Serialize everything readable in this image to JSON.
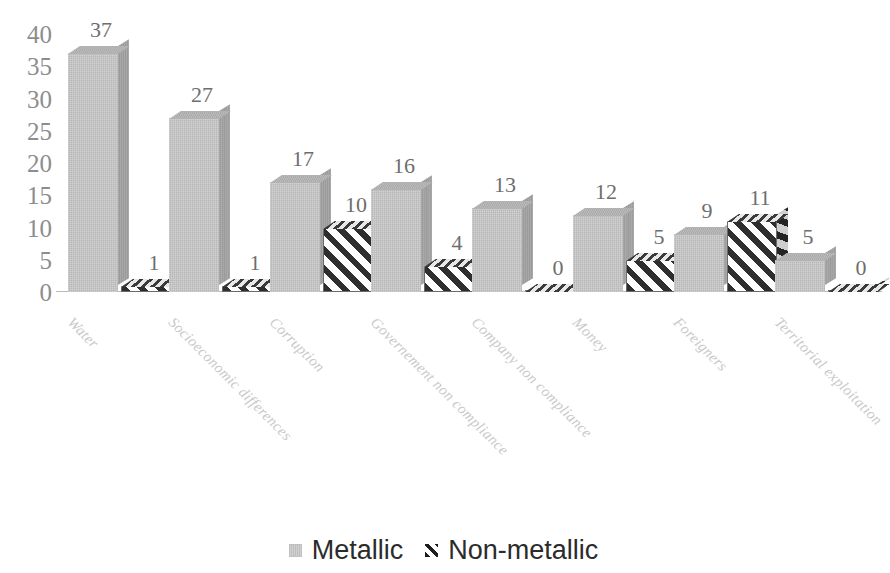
{
  "chart_data": {
    "type": "bar",
    "title": "",
    "subtitle": "",
    "xlabel": "",
    "ylabel": "",
    "grid": false,
    "legend_position": "bottom-center",
    "ylim": [
      0,
      40
    ],
    "yticks": [
      40,
      35,
      30,
      25,
      20,
      15,
      10,
      5,
      0
    ],
    "categories": [
      "Water",
      "Socioeconomic differences",
      "Corruption",
      "Governement non compliance",
      "Company non compliance",
      "Money",
      "Foreigners",
      "Territorial exploitation"
    ],
    "series": [
      {
        "name": "Metallic",
        "color": "#c7c7c7",
        "pattern": "solid",
        "values": [
          37,
          27,
          17,
          16,
          13,
          12,
          9,
          5
        ]
      },
      {
        "name": "Non-metallic",
        "color": "#2e2e2e",
        "pattern": "diagonal-hatch",
        "values": [
          1,
          1,
          10,
          4,
          0,
          5,
          11,
          0
        ]
      }
    ],
    "data_labels": {
      "metallic": [
        "37",
        "27",
        "17",
        "16",
        "13",
        "12",
        "9",
        "5"
      ],
      "non_metallic": [
        "1",
        "1",
        "10",
        "4",
        "0",
        "5",
        "11",
        "0"
      ]
    }
  },
  "legend": {
    "items": [
      {
        "label": "Metallic",
        "swatch": "metallic-swatch-icon"
      },
      {
        "label": "Non-metallic",
        "swatch": "nonmetallic-hatch-swatch-icon"
      }
    ]
  },
  "axis": {
    "y_tick_labels": [
      "40",
      "35",
      "30",
      "25",
      "20",
      "15",
      "10",
      "5",
      "0"
    ]
  },
  "colors": {
    "metallic_face": "#c7c7c7",
    "metallic_side": "#a2a2a2",
    "metallic_top": "#b4b4b4",
    "hatch_dark": "#2e2e2e",
    "hatch_light": "#fdfdfd",
    "axis_line": "#b9b9b9",
    "tick_text": "#8d8d8d",
    "data_label_text": "#6e6e6e",
    "category_label_text": "#c9c9c9",
    "legend_text": "#2b2b2b"
  }
}
